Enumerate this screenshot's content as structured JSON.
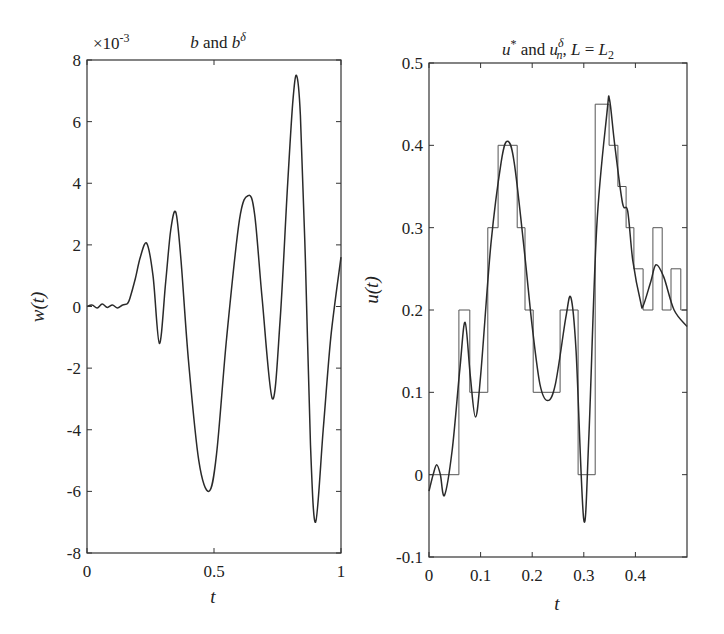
{
  "chart_data": [
    {
      "type": "line",
      "title": "b and b^δ",
      "title_parts": {
        "a": "b",
        "and": " and ",
        "b": "b",
        "sup": "δ"
      },
      "xlabel": "t",
      "ylabel": "w(t)",
      "xlim": [
        0,
        1
      ],
      "ylim": [
        -8,
        8
      ],
      "y_multiplier": "×10",
      "y_multiplier_exp": "-3",
      "xticks": [
        0,
        0.5,
        1
      ],
      "xtick_labels": [
        "0",
        "0.5",
        "1"
      ],
      "yticks": [
        -8,
        -6,
        -4,
        -2,
        0,
        2,
        4,
        6,
        8
      ],
      "ytick_labels": [
        "-8",
        "-6",
        "-4",
        "-2",
        "0",
        "2",
        "4",
        "6",
        "8"
      ],
      "grid": false,
      "series": [
        {
          "name": "b / b^δ",
          "x": [
            0,
            0.02,
            0.04,
            0.06,
            0.08,
            0.1,
            0.12,
            0.14,
            0.16,
            0.17,
            0.19,
            0.21,
            0.235,
            0.26,
            0.285,
            0.31,
            0.33,
            0.35,
            0.37,
            0.4,
            0.44,
            0.48,
            0.51,
            0.55,
            0.6,
            0.635,
            0.66,
            0.69,
            0.73,
            0.76,
            0.79,
            0.81,
            0.825,
            0.84,
            0.86,
            0.88,
            0.9,
            0.93,
            0.96,
            1.0
          ],
          "values": [
            0,
            0.05,
            -0.05,
            0.08,
            -0.03,
            0.05,
            -0.05,
            0.05,
            0.1,
            0.3,
            0.9,
            1.6,
            2.05,
            1.0,
            -1.2,
            0.8,
            2.5,
            3.05,
            1.5,
            -1.8,
            -5.0,
            -6.0,
            -4.8,
            -1.0,
            2.8,
            3.6,
            3.0,
            0.2,
            -3.0,
            -0.5,
            4.0,
            6.6,
            7.5,
            6.2,
            1.5,
            -4.5,
            -7.0,
            -4.0,
            -1.0,
            1.6
          ]
        }
      ]
    },
    {
      "type": "line",
      "title": "u* and u_n^δ, L = L_2",
      "title_parts": {
        "u": "u",
        "star": "*",
        "and": " and ",
        "u2": "u",
        "sub": "n",
        "sup": "δ",
        "rest1": ", ",
        "L": "L",
        "eq": " = ",
        "L2": "L",
        "sub2": "2"
      },
      "xlabel": "t",
      "ylabel": "u(t)",
      "xlim": [
        0,
        0.5
      ],
      "ylim": [
        -0.1,
        0.5
      ],
      "xticks": [
        0,
        0.1,
        0.2,
        0.3,
        0.4
      ],
      "xtick_labels": [
        "0",
        "0.1",
        "0.2",
        "0.3",
        "0.4"
      ],
      "yticks": [
        -0.1,
        0,
        0.1,
        0.2,
        0.3,
        0.4,
        0.5
      ],
      "ytick_labels": [
        "-0.1",
        "0",
        "0.1",
        "0.2",
        "0.3",
        "0.4",
        "0.5"
      ],
      "grid": false,
      "series": [
        {
          "name": "u*",
          "style": "smooth",
          "x": [
            0,
            0.008,
            0.015,
            0.022,
            0.03,
            0.045,
            0.06,
            0.07,
            0.08,
            0.09,
            0.1,
            0.12,
            0.14,
            0.152,
            0.165,
            0.185,
            0.2,
            0.215,
            0.23,
            0.245,
            0.265,
            0.275,
            0.285,
            0.3,
            0.31,
            0.325,
            0.345,
            0.35,
            0.36,
            0.375,
            0.385,
            0.395,
            0.41,
            0.415,
            0.43,
            0.44,
            0.455,
            0.475,
            0.5
          ],
          "values": [
            -0.02,
            0.0,
            0.012,
            0.0,
            -0.025,
            0.03,
            0.13,
            0.185,
            0.12,
            0.07,
            0.12,
            0.28,
            0.38,
            0.405,
            0.38,
            0.27,
            0.18,
            0.11,
            0.09,
            0.11,
            0.19,
            0.215,
            0.15,
            -0.055,
            0.05,
            0.3,
            0.44,
            0.455,
            0.4,
            0.33,
            0.32,
            0.26,
            0.21,
            0.205,
            0.235,
            0.255,
            0.24,
            0.2,
            0.18
          ]
        },
        {
          "name": "u_n^δ",
          "style": "step",
          "edges": [
            0,
            0.058,
            0.079,
            0.114,
            0.134,
            0.171,
            0.186,
            0.202,
            0.254,
            0.289,
            0.322,
            0.349,
            0.366,
            0.382,
            0.397,
            0.415,
            0.434,
            0.452,
            0.469,
            0.488,
            0.5
          ],
          "values": [
            0,
            0.2,
            0.1,
            0.3,
            0.4,
            0.3,
            0.2,
            0.1,
            0.2,
            0,
            0.45,
            0.4,
            0.35,
            0.3,
            0.25,
            0.2,
            0.3,
            0.2,
            0.25,
            0.2
          ]
        }
      ]
    }
  ]
}
